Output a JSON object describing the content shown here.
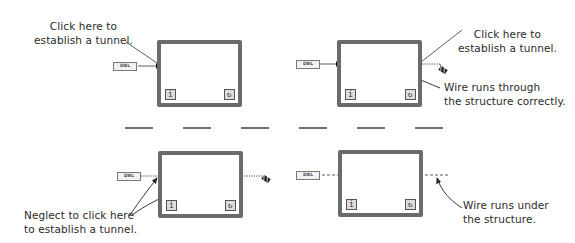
{
  "panels": [
    {
      "id": "top-left",
      "terminal_label": "DBL",
      "iteration_icon": "i",
      "loop_condition_icon": "loop-condition-icon",
      "annotations": [
        {
          "lines": [
            "Click here to",
            "establish a tunnel."
          ]
        }
      ]
    },
    {
      "id": "top-right",
      "terminal_label": "DBL",
      "iteration_icon": "i",
      "loop_condition_icon": "loop-condition-icon",
      "annotations": [
        {
          "lines": [
            "Click here to",
            "establish a tunnel."
          ]
        },
        {
          "lines": [
            "Wire runs through",
            "the structure correctly."
          ]
        }
      ]
    },
    {
      "id": "bottom-left",
      "terminal_label": "DBL",
      "iteration_icon": "i",
      "loop_condition_icon": "loop-condition-icon",
      "annotations": [
        {
          "lines": [
            "Neglect to click here",
            "to establish a tunnel."
          ]
        }
      ]
    },
    {
      "id": "bottom-right",
      "terminal_label": "DBL",
      "iteration_icon": "i",
      "loop_condition_icon": "loop-condition-icon",
      "annotations": [
        {
          "lines": [
            "Wire runs under",
            "the structure."
          ]
        }
      ]
    }
  ],
  "colors": {
    "structure_border": "#6b6b6b",
    "wire": "#333333",
    "text": "#2a2a2a"
  }
}
